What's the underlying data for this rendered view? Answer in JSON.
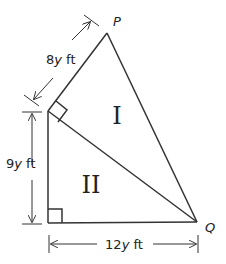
{
  "figure": {
    "vertices": {
      "top": "P",
      "right": "Q"
    },
    "regions": {
      "upper": "I",
      "lower": "II"
    },
    "dimensions": {
      "slanted_left": {
        "coef": "8",
        "var": "y",
        "unit": " ft"
      },
      "vertical_left": {
        "coef": "9",
        "var": "y",
        "unit": " ft"
      },
      "bottom": {
        "coef": "12",
        "var": "y",
        "unit": " ft"
      }
    },
    "colors": {
      "stroke": "#333333",
      "background": "#ffffff"
    }
  }
}
